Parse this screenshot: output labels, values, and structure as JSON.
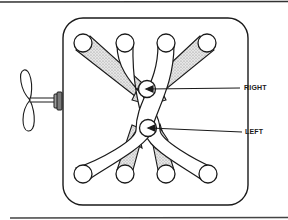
{
  "diagram": {
    "type": "mechanical-schematic",
    "labels": {
      "right": "RIGHT",
      "left": "LEFT"
    },
    "colors": {
      "stroke": "#1a1a1a",
      "stipple": "#b8b8b8",
      "background": "#ffffff"
    },
    "components": {
      "frame": "rounded-rectangle-housing",
      "top_ports": 4,
      "bottom_ports": 4,
      "center_pivots": [
        "RIGHT",
        "LEFT"
      ],
      "propeller": "two-blade-propeller",
      "pulley": "drive-pulley"
    }
  }
}
